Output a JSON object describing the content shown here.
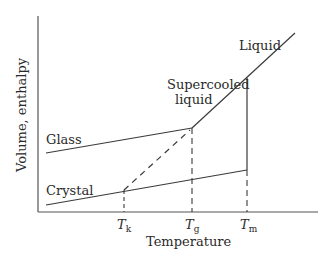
{
  "diagram": {
    "title": "",
    "y_axis_label": "Volume, enthalpy",
    "x_axis_label": "Temperature",
    "curve_labels": {
      "liquid": "Liquid",
      "supercooled_line1": "Supercooled",
      "supercooled_line2": "liquid",
      "glass": "Glass",
      "crystal": "Crystal"
    },
    "ticks": {
      "tk": {
        "main": "T",
        "sub": "k"
      },
      "tg": {
        "main": "T",
        "sub": "g"
      },
      "tm": {
        "main": "T",
        "sub": "m"
      }
    },
    "colors": {
      "line": "#3a3a3a",
      "text": "#2a2a2a"
    }
  }
}
